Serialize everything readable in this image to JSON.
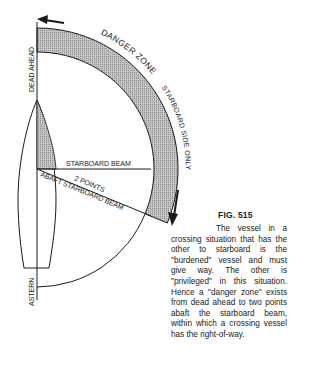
{
  "figure": {
    "title": "FIG. 515",
    "caption": "The vessel in a crossing situation that has the other to starboard is the \"burdened\" vessel and must give way. The other is \"privileged\" in this situation. Hence a \"danger zone\" exists from dead ahead to two points abaft the starboard beam, within which a crossing vessel has the right-of-way."
  },
  "labels": {
    "danger_zone": "DANGER ZONE",
    "starboard_side_only": "STARBOARD SIDE ONLY",
    "dead_ahead": "DEAD AHEAD",
    "astern": "ASTERN",
    "starboard_beam": "STARBOARD BEAM",
    "two_points": "2 POINTS",
    "abaft_starboard_beam": "ABAFT STARBOARD BEAM"
  },
  "colors": {
    "ink": "#1a1a1a",
    "hatch_fill": "#b5b5b5",
    "background": "#ffffff"
  }
}
